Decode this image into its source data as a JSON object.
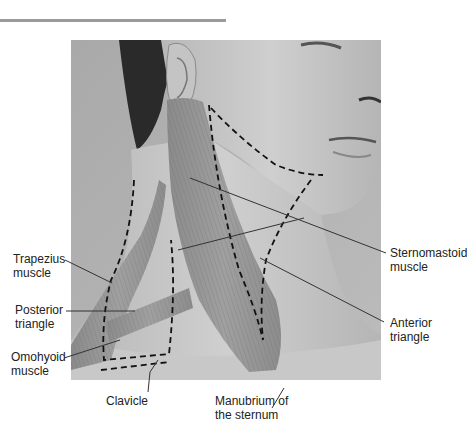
{
  "figure": {
    "labels": {
      "trapezius": [
        "Trapezius",
        "muscle"
      ],
      "posterior_triangle": [
        "Posterior",
        "triangle"
      ],
      "omohyoid": [
        "Omohyoid",
        "muscle"
      ],
      "clavicle": [
        "Clavicle"
      ],
      "manubrium": [
        "Manubrium of",
        "the sternum"
      ],
      "sternomastoid": [
        "Sternomastoid",
        "muscle"
      ],
      "anterior_triangle": [
        "Anterior",
        "triangle"
      ]
    }
  },
  "colors": {
    "rule": "#9a9a9a",
    "text": "#222222",
    "leader": "#333333",
    "dashed_outline": "#111111",
    "background": "#ffffff"
  }
}
